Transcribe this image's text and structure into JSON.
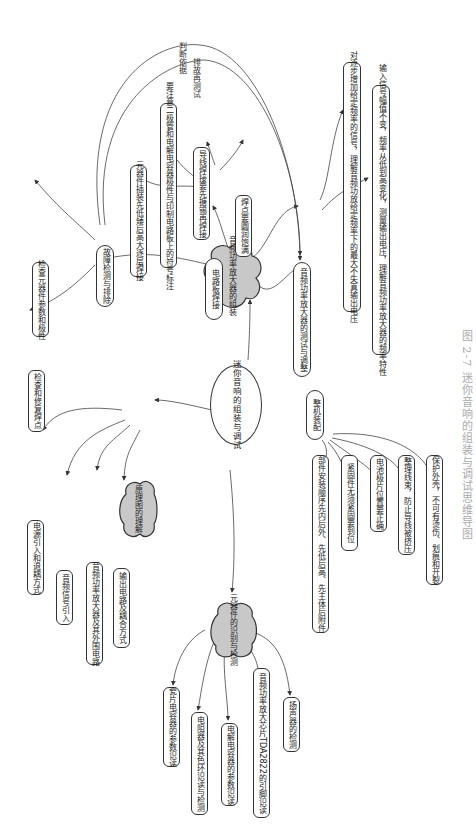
{
  "caption": "图 2-7  迷你音响的组装与调试思维导图",
  "center": {
    "label": "迷你音响的组装与调试"
  },
  "branches": {
    "understanding": {
      "label": "原理图的理解",
      "children": [
        "电源引入和退耦方式",
        "音频信号引入",
        "音频功率放大器及其外围电路",
        "输出电路及耦合方式"
      ]
    },
    "components": {
      "label": "元器件的识别与检测",
      "children": [
        "瓷片电容器的参数识读",
        "电阻器及其色环识读与检测",
        "电解电容器的参数识读",
        "音频功率放大芯片TDA2822的引脚识读",
        "扬声器的检测"
      ]
    },
    "assembly_group": {
      "label": "音频功率放大器的组装",
      "children": {
        "soldering": {
          "label": "电路板焊接",
          "children": [
            "元器件插装先低矮后高大逐层焊接",
            "要注意二极管和电解电容器极性与印制电路板上的符号标注",
            "导线焊接要先搪锡再焊接",
            "焊点要圆润饱满"
          ]
        },
        "testing": {
          "label": "音频功率放大器的测试与调整",
          "children": [
            "对逐步增加给定频率的信号，理解音频功放给定频率下的最大不失真输出电压",
            "输入信号幅值不变，频率从低到高变化，测量输出电压，理解音频功率放大器的频率特性"
          ]
        },
        "troubleshooting": {
          "label": "故障检测与排除",
          "children": [
            "检查元器件参数和极性",
            "检查和修复焊点"
          ]
        },
        "final_assembly": {
          "label": "整机装配",
          "children": [
            "部件安装顺序先内后外、先低后高、先主体后附件",
            "紧固件无须紧固要到位",
            "电池极片位置要正确",
            "整理线束，防止导线被挤压",
            "保护外壳，不可有烫伤、划痕和开裂"
          ]
        }
      }
    }
  },
  "edge_labels": {
    "judge": "判断依据",
    "retest": "排故再测试"
  },
  "colors": {
    "cloud_fill": "#c8c8c8",
    "stroke": "#333333",
    "caption": "#aaaaaa"
  }
}
